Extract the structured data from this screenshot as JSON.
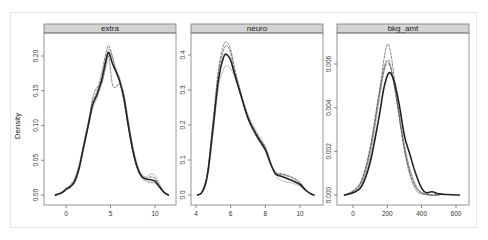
{
  "ylabel": "Density",
  "chart_data": [
    {
      "type": "line",
      "title": "extra",
      "xlabel": "",
      "ylabel": "Density",
      "xlim": [
        -1.5,
        11.5
      ],
      "ylim": [
        0,
        0.22
      ],
      "x_ticks": [
        0,
        5,
        10
      ],
      "y_ticks": [
        "0.00",
        "0.05",
        "0.10",
        "0.15",
        "0.20"
      ],
      "grid": false,
      "series": [
        {
          "name": "observed",
          "style": "solid-thick",
          "x": [
            -1.2,
            -0.5,
            0,
            0.5,
            1,
            1.5,
            2,
            2.5,
            3,
            3.5,
            4,
            4.5,
            4.8,
            5.2,
            5.6,
            6,
            6.5,
            7,
            7.5,
            8,
            8.5,
            9,
            9.5,
            10,
            10.5,
            11,
            11.5
          ],
          "y": [
            0.0,
            0.003,
            0.008,
            0.012,
            0.02,
            0.04,
            0.07,
            0.1,
            0.13,
            0.145,
            0.165,
            0.195,
            0.205,
            0.19,
            0.178,
            0.165,
            0.14,
            0.1,
            0.065,
            0.04,
            0.027,
            0.023,
            0.022,
            0.02,
            0.012,
            0.004,
            0.0
          ]
        },
        {
          "name": "replicate-1",
          "style": "dashed",
          "x": [
            -1.2,
            -0.5,
            0,
            0.5,
            1,
            1.5,
            2,
            2.5,
            3,
            3.5,
            4,
            4.5,
            4.8,
            5.2,
            5.6,
            6,
            6.5,
            7,
            7.5,
            8,
            8.5,
            9,
            9.5,
            10,
            10.5,
            11,
            11.5
          ],
          "y": [
            0.0,
            0.004,
            0.01,
            0.015,
            0.025,
            0.045,
            0.075,
            0.105,
            0.135,
            0.15,
            0.175,
            0.205,
            0.215,
            0.2,
            0.18,
            0.165,
            0.135,
            0.098,
            0.062,
            0.038,
            0.026,
            0.024,
            0.026,
            0.024,
            0.014,
            0.005,
            0.0
          ]
        },
        {
          "name": "replicate-2",
          "style": "dashed",
          "x": [
            -1.2,
            -0.5,
            0,
            0.5,
            1,
            1.5,
            2,
            2.5,
            3,
            3.5,
            4,
            4.5,
            4.8,
            5.2,
            5.6,
            6,
            6.5,
            7,
            7.5,
            8,
            8.5,
            9,
            9.5,
            10,
            10.5,
            11,
            11.5
          ],
          "y": [
            0.0,
            0.003,
            0.009,
            0.013,
            0.022,
            0.042,
            0.072,
            0.102,
            0.14,
            0.155,
            0.16,
            0.185,
            0.2,
            0.16,
            0.155,
            0.16,
            0.145,
            0.105,
            0.07,
            0.042,
            0.025,
            0.02,
            0.018,
            0.017,
            0.01,
            0.003,
            0.0
          ]
        },
        {
          "name": "replicate-3",
          "style": "dotted",
          "x": [
            -1.2,
            -0.5,
            0,
            0.5,
            1,
            1.5,
            2,
            2.5,
            3,
            3.5,
            4,
            4.5,
            4.8,
            5.2,
            5.6,
            6,
            6.5,
            7,
            7.5,
            8,
            8.5,
            9,
            9.5,
            10,
            10.5,
            11,
            11.5
          ],
          "y": [
            0.0,
            0.002,
            0.007,
            0.011,
            0.019,
            0.038,
            0.068,
            0.098,
            0.125,
            0.14,
            0.16,
            0.19,
            0.21,
            0.198,
            0.182,
            0.17,
            0.145,
            0.108,
            0.07,
            0.045,
            0.03,
            0.026,
            0.03,
            0.028,
            0.016,
            0.005,
            0.0
          ]
        }
      ]
    },
    {
      "type": "line",
      "title": "neuro",
      "xlabel": "",
      "ylabel": "",
      "xlim": [
        3.8,
        11.2
      ],
      "ylim": [
        0,
        0.45
      ],
      "x_ticks": [
        4,
        6,
        8,
        10
      ],
      "y_ticks": [
        "0.0",
        "0.1",
        "0.2",
        "0.3",
        "0.4"
      ],
      "grid": false,
      "series": [
        {
          "name": "observed",
          "style": "solid-thick",
          "x": [
            4.1,
            4.3,
            4.5,
            4.7,
            5.0,
            5.3,
            5.6,
            5.8,
            6.0,
            6.2,
            6.5,
            7.0,
            7.5,
            8.0,
            8.3,
            8.6,
            9.0,
            9.5,
            10.0,
            10.3,
            10.6,
            10.8
          ],
          "y": [
            0.0,
            0.005,
            0.025,
            0.07,
            0.2,
            0.33,
            0.395,
            0.4,
            0.385,
            0.35,
            0.3,
            0.22,
            0.17,
            0.13,
            0.09,
            0.06,
            0.052,
            0.042,
            0.03,
            0.015,
            0.004,
            0.0
          ]
        },
        {
          "name": "replicate-1",
          "style": "dashed",
          "x": [
            4.1,
            4.3,
            4.5,
            4.7,
            5.0,
            5.3,
            5.6,
            5.8,
            6.0,
            6.2,
            6.5,
            7.0,
            7.5,
            8.0,
            8.3,
            8.6,
            9.0,
            9.5,
            10.0,
            10.3,
            10.6,
            10.8
          ],
          "y": [
            0.0,
            0.005,
            0.027,
            0.075,
            0.21,
            0.35,
            0.415,
            0.425,
            0.405,
            0.36,
            0.3,
            0.215,
            0.165,
            0.125,
            0.088,
            0.062,
            0.058,
            0.05,
            0.035,
            0.016,
            0.004,
            0.0
          ]
        },
        {
          "name": "replicate-2",
          "style": "dotted",
          "x": [
            4.1,
            4.3,
            4.5,
            4.7,
            5.0,
            5.3,
            5.6,
            5.8,
            6.0,
            6.2,
            6.5,
            7.0,
            7.5,
            8.0,
            8.3,
            8.6,
            9.0,
            9.5,
            10.0,
            10.3,
            10.6,
            10.8
          ],
          "y": [
            0.0,
            0.004,
            0.02,
            0.06,
            0.18,
            0.31,
            0.36,
            0.37,
            0.36,
            0.34,
            0.3,
            0.23,
            0.18,
            0.14,
            0.095,
            0.055,
            0.04,
            0.035,
            0.025,
            0.013,
            0.003,
            0.0
          ]
        },
        {
          "name": "replicate-3",
          "style": "dashed",
          "x": [
            4.1,
            4.3,
            4.5,
            4.7,
            5.0,
            5.3,
            5.6,
            5.8,
            6.0,
            6.2,
            6.5,
            7.0,
            7.5,
            8.0,
            8.3,
            8.6,
            9.0,
            9.5,
            10.0,
            10.3,
            10.6,
            10.8
          ],
          "y": [
            0.0,
            0.006,
            0.028,
            0.08,
            0.22,
            0.36,
            0.43,
            0.435,
            0.415,
            0.37,
            0.31,
            0.225,
            0.175,
            0.135,
            0.092,
            0.065,
            0.06,
            0.052,
            0.036,
            0.017,
            0.004,
            0.0
          ]
        }
      ]
    },
    {
      "type": "line",
      "title": "bkg_amt",
      "xlabel": "",
      "ylabel": "",
      "xlim": [
        -100,
        680
      ],
      "ylim": [
        0,
        0.0072
      ],
      "x_ticks": [
        0,
        200,
        400,
        600
      ],
      "y_ticks": [
        "0.000",
        "0.002",
        "0.004",
        "0.006"
      ],
      "grid": false,
      "series": [
        {
          "name": "observed",
          "style": "solid-thick",
          "x": [
            -50,
            0,
            50,
            100,
            150,
            180,
            210,
            240,
            270,
            300,
            330,
            360,
            400,
            430,
            460,
            500,
            550,
            620
          ],
          "y": [
            0.0,
            0.0001,
            0.0004,
            0.0015,
            0.0035,
            0.0049,
            0.0056,
            0.0052,
            0.0041,
            0.0027,
            0.0019,
            0.0011,
            0.0003,
            0.0001,
            0.00015,
            5e-05,
            2e-05,
            0.0
          ]
        },
        {
          "name": "replicate-1",
          "style": "dashed",
          "x": [
            -50,
            0,
            50,
            100,
            150,
            180,
            200,
            220,
            250,
            280,
            310,
            340,
            370,
            400,
            450,
            500
          ],
          "y": [
            0.0,
            0.00015,
            0.0006,
            0.002,
            0.0045,
            0.0062,
            0.0069,
            0.0065,
            0.0048,
            0.003,
            0.0016,
            0.0007,
            0.0002,
            5e-05,
            0.0,
            0.0
          ]
        },
        {
          "name": "replicate-2",
          "style": "dashed",
          "x": [
            -50,
            0,
            50,
            100,
            150,
            180,
            200,
            220,
            250,
            280,
            310,
            340,
            370,
            400,
            450,
            500
          ],
          "y": [
            0.0,
            0.0002,
            0.0007,
            0.0022,
            0.0046,
            0.0058,
            0.0062,
            0.0059,
            0.0045,
            0.003,
            0.0017,
            0.0008,
            0.0003,
            0.0001,
            0.0,
            0.0
          ]
        },
        {
          "name": "replicate-3",
          "style": "dotted",
          "x": [
            -50,
            0,
            50,
            100,
            150,
            180,
            200,
            220,
            250,
            280,
            310,
            340,
            370,
            400,
            450,
            500
          ],
          "y": [
            0.0,
            0.00012,
            0.0005,
            0.0018,
            0.0042,
            0.0056,
            0.006,
            0.0058,
            0.0047,
            0.0032,
            0.0019,
            0.001,
            0.0004,
            0.00012,
            0.0,
            0.0
          ]
        },
        {
          "name": "replicate-4",
          "style": "dashed",
          "x": [
            -50,
            0,
            50,
            100,
            150,
            180,
            200,
            220,
            250,
            280,
            310,
            340,
            370,
            400,
            450,
            500
          ],
          "y": [
            0.0,
            0.00018,
            0.00065,
            0.0021,
            0.0044,
            0.0057,
            0.0061,
            0.0058,
            0.0046,
            0.0031,
            0.0018,
            0.0009,
            0.00035,
            0.0001,
            0.0,
            0.0
          ]
        }
      ]
    }
  ]
}
